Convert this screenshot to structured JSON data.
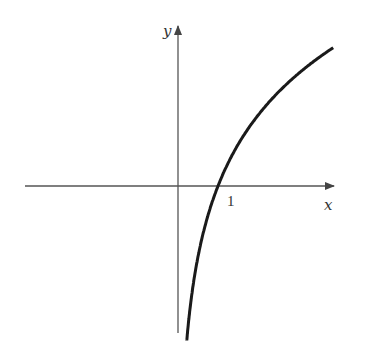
{
  "figure": {
    "x_axis_label": "x",
    "y_axis_label": "y",
    "x_tick_label": "1",
    "curve": "y = ln x",
    "x_intercept": 1
  },
  "colors": {
    "axis": "#555555",
    "curve": "#1a1a1a",
    "background": "#ffffff"
  }
}
